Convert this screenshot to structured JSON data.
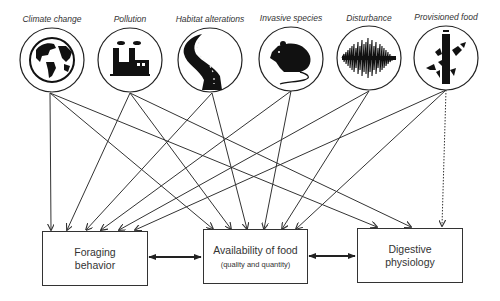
{
  "diagram": {
    "type": "conceptual-flow",
    "drivers": [
      {
        "id": "climate",
        "label": "Climate change",
        "icon": "globe-icon",
        "cx": 52,
        "cy": 60
      },
      {
        "id": "pollution",
        "label": "Pollution",
        "icon": "factory-icon",
        "cx": 130,
        "cy": 60
      },
      {
        "id": "habitat",
        "label": "Habitat alterations",
        "icon": "road-icon",
        "cx": 210,
        "cy": 60
      },
      {
        "id": "invasive",
        "label": "Invasive species",
        "icon": "rat-icon",
        "cx": 291,
        "cy": 59
      },
      {
        "id": "disturbance",
        "label": "Disturbance",
        "icon": "sound-wave-icon",
        "cx": 369,
        "cy": 58
      },
      {
        "id": "provisioned",
        "label": "Provisioned food",
        "icon": "bird-feeder-icon",
        "cx": 446,
        "cy": 58
      }
    ],
    "outcomes": [
      {
        "id": "foraging",
        "label": "Foraging behavior",
        "line1": "Foraging",
        "line2": "behavior",
        "sub": ""
      },
      {
        "id": "availability",
        "label": "Availability of food (quality and quantity)",
        "line1": "Availability of food",
        "line2": "",
        "sub": "(quality and quantity)"
      },
      {
        "id": "digestive",
        "label": "Digestive physiology",
        "line1": "Digestive",
        "line2": "physiology",
        "sub": ""
      }
    ],
    "edges": [
      {
        "from": "climate",
        "to": "foraging",
        "style": "solid"
      },
      {
        "from": "climate",
        "to": "availability",
        "style": "solid"
      },
      {
        "from": "climate",
        "to": "digestive",
        "style": "solid"
      },
      {
        "from": "pollution",
        "to": "foraging",
        "style": "solid"
      },
      {
        "from": "pollution",
        "to": "availability",
        "style": "solid"
      },
      {
        "from": "pollution",
        "to": "digestive",
        "style": "solid"
      },
      {
        "from": "habitat",
        "to": "foraging",
        "style": "solid"
      },
      {
        "from": "habitat",
        "to": "availability",
        "style": "solid"
      },
      {
        "from": "invasive",
        "to": "foraging",
        "style": "solid"
      },
      {
        "from": "invasive",
        "to": "availability",
        "style": "solid"
      },
      {
        "from": "disturbance",
        "to": "foraging",
        "style": "solid"
      },
      {
        "from": "disturbance",
        "to": "availability",
        "style": "solid"
      },
      {
        "from": "provisioned",
        "to": "foraging",
        "style": "solid"
      },
      {
        "from": "provisioned",
        "to": "availability",
        "style": "solid"
      },
      {
        "from": "provisioned",
        "to": "digestive",
        "style": "dotted"
      }
    ],
    "bidirectional_links": [
      {
        "between": [
          "foraging",
          "availability"
        ]
      },
      {
        "between": [
          "availability",
          "digestive"
        ]
      }
    ],
    "colors": {
      "line": "#333333",
      "background": "#ffffff",
      "icon": "#111111"
    }
  }
}
